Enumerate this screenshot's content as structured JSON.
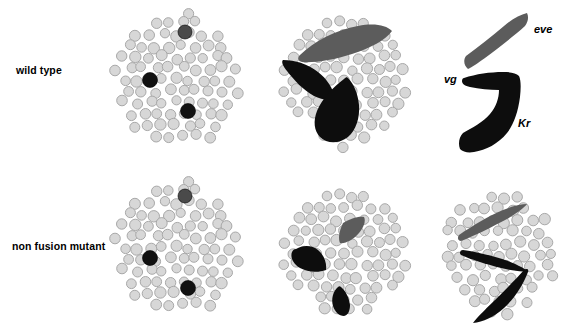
{
  "figure": {
    "type": "biological-schematic",
    "width": 567,
    "height": 325,
    "background": "#ffffff"
  },
  "rows": [
    {
      "id": "wild-type",
      "label": "wild type",
      "label_x": 16,
      "label_y": 64
    },
    {
      "id": "non-fusion-mutant",
      "label": "non fusion mutant",
      "label_x": 12,
      "label_y": 240
    }
  ],
  "gene_labels": [
    {
      "id": "eve",
      "text": "eve",
      "x": 534,
      "y": 23,
      "color": "#5c5c5c"
    },
    {
      "id": "vg",
      "text": "vg",
      "x": 444,
      "y": 73,
      "color": "#000000"
    },
    {
      "id": "Kr",
      "text": "Kr",
      "x": 518,
      "y": 117,
      "color": "#000000"
    }
  ],
  "colors": {
    "cell_fill": "#d7d7d7",
    "cell_stroke": "#a8a8a8",
    "founder_dark_gray": "#4a4a4a",
    "founder_black": "#111111",
    "domain_gray": "#5c5c5c",
    "domain_black": "#0d0d0d",
    "text": "#000000"
  },
  "panels": [
    {
      "id": "wild-type-cells",
      "row": "wild type",
      "column": 1,
      "description": "cluster of myoblast cells with three marked founder cells",
      "cell_count": 66,
      "founder_cells": [
        {
          "x": 185,
          "y": 32,
          "r": 7.0,
          "color": "#4a4a4a"
        },
        {
          "x": 150,
          "y": 80,
          "r": 7.5,
          "color": "#111111"
        },
        {
          "x": 188,
          "y": 111,
          "r": 7.5,
          "color": "#111111"
        }
      ]
    },
    {
      "id": "wild-type-domains",
      "row": "wild type",
      "column": 2,
      "description": "cells with three fused elongated muscle precursor domains",
      "cell_count": 52,
      "shapes": [
        {
          "id": "eve-domain",
          "color": "#5c5c5c",
          "form": "elongated-lens"
        },
        {
          "id": "vg-domain",
          "color": "#0d0d0d",
          "form": "tapered-wedge"
        },
        {
          "id": "Kr-domain",
          "color": "#0d0d0d",
          "form": "teardrop"
        }
      ]
    },
    {
      "id": "wild-type-isolated",
      "row": "wild type",
      "column": 3,
      "description": "isolated muscle precursor domains labelled eve, vg and Kr",
      "shapes": [
        {
          "id": "eve-band",
          "color": "#5c5c5c",
          "form": "curved-band"
        },
        {
          "id": "vg-Kr-hook",
          "color": "#0d0d0d",
          "form": "hook"
        }
      ]
    },
    {
      "id": "mutant-cells",
      "row": "non fusion mutant",
      "column": 1,
      "description": "cluster of myoblast cells with three marked founder cells",
      "cell_count": 66,
      "founder_cells": [
        {
          "x": 185,
          "y": 196,
          "r": 7.0,
          "color": "#4a4a4a"
        },
        {
          "x": 150,
          "y": 258,
          "r": 7.5,
          "color": "#111111"
        },
        {
          "x": 188,
          "y": 288,
          "r": 7.5,
          "color": "#111111"
        }
      ]
    },
    {
      "id": "mutant-domains",
      "row": "non fusion mutant",
      "column": 2,
      "description": "cells with three small unfused precursor blobs",
      "cell_count": 52,
      "shapes": [
        {
          "id": "eve-blob",
          "color": "#5c5c5c",
          "form": "small-lens"
        },
        {
          "id": "vg-blob",
          "color": "#0d0d0d",
          "form": "small-wedge"
        },
        {
          "id": "Kr-blob",
          "color": "#0d0d0d",
          "form": "small-teardrop"
        }
      ]
    },
    {
      "id": "mutant-overlay",
      "row": "non fusion mutant",
      "column": 3,
      "description": "cells overlaid with thin tapered outline curves of the precursor domains",
      "cell_count": 62,
      "shapes": [
        {
          "id": "eve-curve",
          "color": "#5c5c5c",
          "form": "thin-curve"
        },
        {
          "id": "vg-curve",
          "color": "#0d0d0d",
          "form": "thin-curve"
        },
        {
          "id": "Kr-curve",
          "color": "#0d0d0d",
          "form": "thin-curve"
        }
      ]
    }
  ]
}
